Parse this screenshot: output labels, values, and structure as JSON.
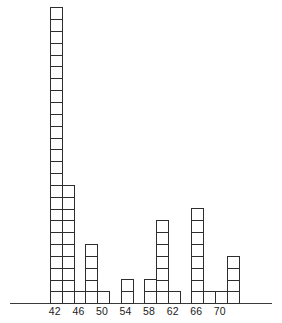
{
  "chart_data": {
    "type": "bar",
    "title": "",
    "xlabel": "",
    "ylabel": "",
    "style": "stacked unit squares (each square = 1 count)",
    "categories": [
      "42",
      "44",
      "46",
      "48",
      "50",
      "52",
      "54",
      "56",
      "58",
      "60",
      "62",
      "64",
      "66",
      "68",
      "70",
      "72"
    ],
    "values": [
      25,
      10,
      1,
      5,
      1,
      0,
      2,
      0,
      2,
      7,
      1,
      0,
      8,
      1,
      1,
      4
    ],
    "tick_labels": [
      "42",
      "46",
      "50",
      "54",
      "58",
      "62",
      "66",
      "70"
    ],
    "ylim": [
      0,
      25
    ],
    "grid": false,
    "legend": null
  },
  "layout": {
    "origin_x": 50,
    "baseline_y": 303,
    "col_width": 11.78,
    "cell_height": 11.84
  }
}
